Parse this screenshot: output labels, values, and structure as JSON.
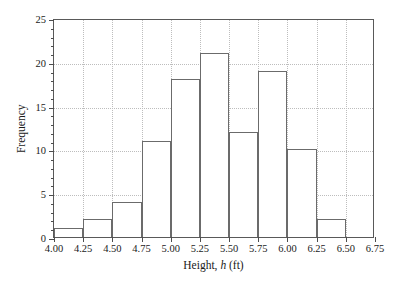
{
  "chart_data": {
    "type": "bar",
    "title": "",
    "subtitle": "",
    "xlabel_prefix": "Height, ",
    "xlabel_variable": "h",
    "xlabel_suffix": " (ft)",
    "xlabel": "Height, h (ft)",
    "ylabel": "Frequency",
    "xlim": [
      4.0,
      6.75
    ],
    "ylim": [
      0,
      25
    ],
    "grid": true,
    "legend": "none",
    "bin_width": 0.25,
    "bin_edges": [
      4.0,
      4.25,
      4.5,
      4.75,
      5.0,
      5.25,
      5.5,
      5.75,
      6.0,
      6.25,
      6.5,
      6.75
    ],
    "categories": [
      "4.00-4.25",
      "4.25-4.50",
      "4.50-4.75",
      "4.75-5.00",
      "5.00-5.25",
      "5.25-5.50",
      "5.50-5.75",
      "5.75-6.00",
      "6.00-6.25",
      "6.25-6.50",
      "6.50-6.75"
    ],
    "values": [
      1,
      2,
      4,
      11,
      18,
      21,
      12,
      19,
      10,
      2,
      0
    ],
    "bars": [
      {
        "x0": 4.0,
        "x1": 4.25,
        "value": 1
      },
      {
        "x0": 4.25,
        "x1": 4.5,
        "value": 2
      },
      {
        "x0": 4.5,
        "x1": 4.75,
        "value": 4
      },
      {
        "x0": 4.75,
        "x1": 5.0,
        "value": 11
      },
      {
        "x0": 5.0,
        "x1": 5.25,
        "value": 18
      },
      {
        "x0": 5.25,
        "x1": 5.5,
        "value": 21
      },
      {
        "x0": 5.5,
        "x1": 5.75,
        "value": 12
      },
      {
        "x0": 5.75,
        "x1": 6.0,
        "value": 19
      },
      {
        "x0": 6.0,
        "x1": 6.25,
        "value": 10
      },
      {
        "x0": 6.25,
        "x1": 6.5,
        "value": 2
      },
      {
        "x0": 6.5,
        "x1": 6.75,
        "value": 0
      }
    ],
    "x_ticks": [
      {
        "value": 4.0,
        "label": "4.00"
      },
      {
        "value": 4.25,
        "label": "4.25"
      },
      {
        "value": 4.5,
        "label": "4.50"
      },
      {
        "value": 4.75,
        "label": "4.75"
      },
      {
        "value": 5.0,
        "label": "5.00"
      },
      {
        "value": 5.25,
        "label": "5.25"
      },
      {
        "value": 5.5,
        "label": "5.50"
      },
      {
        "value": 5.75,
        "label": "5.75"
      },
      {
        "value": 6.0,
        "label": "6.00"
      },
      {
        "value": 6.25,
        "label": "6.25"
      },
      {
        "value": 6.5,
        "label": "6.50"
      },
      {
        "value": 6.75,
        "label": "6.75"
      }
    ],
    "y_ticks": [
      {
        "value": 0,
        "label": "0"
      },
      {
        "value": 5,
        "label": "5"
      },
      {
        "value": 10,
        "label": "10"
      },
      {
        "value": 15,
        "label": "15"
      },
      {
        "value": 20,
        "label": "20"
      },
      {
        "value": 25,
        "label": "25"
      }
    ],
    "y_minor_tick_step": 1,
    "total_frequency": 100,
    "colors": {
      "bar_outline": "#6b6b6b",
      "bar_fill": "#ffffff",
      "frame": "#595959",
      "gridline": "#bdbdbd",
      "tick": "#4d4d4d",
      "text": "#1a1a1a",
      "background": "#ffffff"
    }
  }
}
